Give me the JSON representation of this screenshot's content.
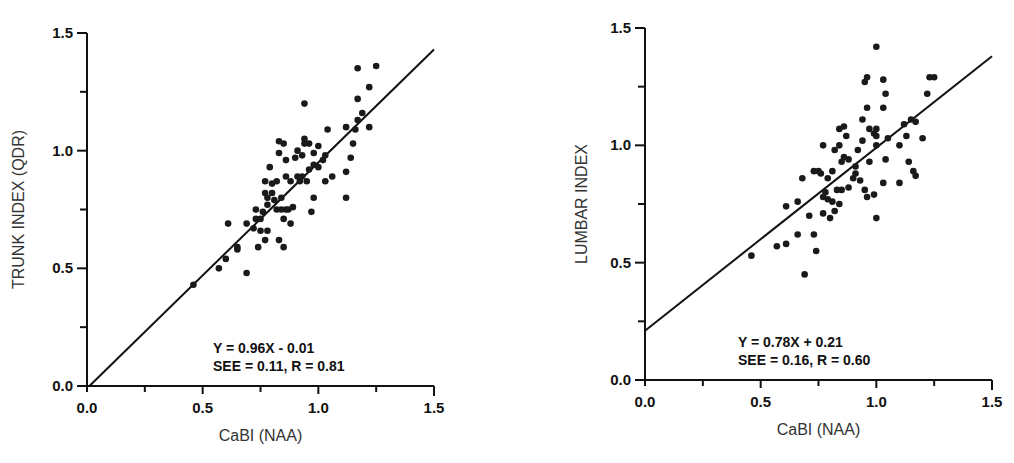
{
  "chart_data": [
    {
      "type": "scatter",
      "title": "",
      "xlabel": "CaBI (NAA)",
      "ylabel": "TRUNK INDEX (QDR)",
      "xlim": [
        0.0,
        1.5
      ],
      "ylim": [
        0.0,
        1.5
      ],
      "xticks": [
        "0.0",
        "0.5",
        "1.0",
        "1.5"
      ],
      "yticks": [
        "0.0",
        "0.5",
        "1.0",
        "1.5"
      ],
      "grid": false,
      "regression": {
        "slope": 0.96,
        "intercept": -0.01
      },
      "annotation": [
        "Y = 0.96X - 0.01",
        "SEE = 0.11, R = 0.81"
      ],
      "points": [
        [
          0.46,
          0.43
        ],
        [
          0.57,
          0.5
        ],
        [
          0.6,
          0.54
        ],
        [
          0.61,
          0.69
        ],
        [
          0.65,
          0.59
        ],
        [
          0.65,
          0.58
        ],
        [
          0.69,
          0.48
        ],
        [
          0.69,
          0.69
        ],
        [
          0.72,
          0.67
        ],
        [
          0.73,
          0.71
        ],
        [
          0.73,
          0.75
        ],
        [
          0.74,
          0.59
        ],
        [
          0.75,
          0.66
        ],
        [
          0.75,
          0.71
        ],
        [
          0.76,
          0.74
        ],
        [
          0.77,
          0.82
        ],
        [
          0.77,
          0.87
        ],
        [
          0.77,
          0.62
        ],
        [
          0.78,
          0.66
        ],
        [
          0.78,
          0.8
        ],
        [
          0.78,
          0.77
        ],
        [
          0.79,
          0.93
        ],
        [
          0.8,
          0.82
        ],
        [
          0.8,
          0.86
        ],
        [
          0.81,
          0.79
        ],
        [
          0.82,
          0.75
        ],
        [
          0.82,
          0.87
        ],
        [
          0.83,
          0.99
        ],
        [
          0.83,
          1.04
        ],
        [
          0.83,
          0.62
        ],
        [
          0.84,
          0.8
        ],
        [
          0.84,
          0.75
        ],
        [
          0.85,
          0.59
        ],
        [
          0.85,
          0.71
        ],
        [
          0.85,
          1.03
        ],
        [
          0.86,
          0.75
        ],
        [
          0.86,
          0.89
        ],
        [
          0.86,
          0.96
        ],
        [
          0.87,
          0.75
        ],
        [
          0.88,
          0.69
        ],
        [
          0.88,
          0.87
        ],
        [
          0.89,
          0.76
        ],
        [
          0.9,
          0.97
        ],
        [
          0.91,
          0.89
        ],
        [
          0.91,
          1.0
        ],
        [
          0.92,
          0.87
        ],
        [
          0.93,
          0.89
        ],
        [
          0.93,
          0.98
        ],
        [
          0.94,
          1.03
        ],
        [
          0.94,
          1.05
        ],
        [
          0.94,
          1.2
        ],
        [
          0.95,
          0.87
        ],
        [
          0.96,
          0.92
        ],
        [
          0.96,
          1.03
        ],
        [
          0.97,
          0.74
        ],
        [
          0.98,
          0.8
        ],
        [
          0.98,
          0.94
        ],
        [
          0.98,
          0.99
        ],
        [
          1.0,
          1.02
        ],
        [
          1.0,
          0.93
        ],
        [
          1.02,
          0.96
        ],
        [
          1.03,
          0.98
        ],
        [
          1.03,
          0.87
        ],
        [
          1.04,
          1.09
        ],
        [
          1.06,
          0.89
        ],
        [
          1.12,
          0.91
        ],
        [
          1.12,
          0.8
        ],
        [
          1.12,
          1.1
        ],
        [
          1.14,
          0.97
        ],
        [
          1.15,
          1.03
        ],
        [
          1.16,
          1.09
        ],
        [
          1.17,
          1.13
        ],
        [
          1.17,
          1.22
        ],
        [
          1.17,
          1.35
        ],
        [
          1.19,
          1.16
        ],
        [
          1.22,
          1.1
        ],
        [
          1.22,
          1.27
        ],
        [
          1.25,
          1.36
        ]
      ]
    },
    {
      "type": "scatter",
      "title": "",
      "xlabel": "CaBI (NAA)",
      "ylabel": "LUMBAR INDEX",
      "xlim": [
        0.0,
        1.5
      ],
      "ylim": [
        0.0,
        1.5
      ],
      "xticks": [
        "0.0",
        "0.5",
        "1.0",
        "1.5"
      ],
      "yticks": [
        "0.0",
        "0.5",
        "1.0",
        "1.5"
      ],
      "grid": false,
      "regression": {
        "slope": 0.78,
        "intercept": 0.21
      },
      "annotation": [
        "Y = 0.78X + 0.21",
        "SEE = 0.16, R = 0.60"
      ],
      "points": [
        [
          0.46,
          0.53
        ],
        [
          0.57,
          0.57
        ],
        [
          0.61,
          0.58
        ],
        [
          0.61,
          0.74
        ],
        [
          0.66,
          0.62
        ],
        [
          0.66,
          0.76
        ],
        [
          0.69,
          0.45
        ],
        [
          0.68,
          0.86
        ],
        [
          0.71,
          0.7
        ],
        [
          0.73,
          0.89
        ],
        [
          0.73,
          0.62
        ],
        [
          0.74,
          0.55
        ],
        [
          0.75,
          0.89
        ],
        [
          0.76,
          0.88
        ],
        [
          0.77,
          0.78
        ],
        [
          0.77,
          1.0
        ],
        [
          0.77,
          0.71
        ],
        [
          0.78,
          0.8
        ],
        [
          0.79,
          0.86
        ],
        [
          0.79,
          0.77
        ],
        [
          0.8,
          0.69
        ],
        [
          0.81,
          0.89
        ],
        [
          0.81,
          0.76
        ],
        [
          0.82,
          0.98
        ],
        [
          0.82,
          0.72
        ],
        [
          0.83,
          0.81
        ],
        [
          0.84,
          0.75
        ],
        [
          0.84,
          1.0
        ],
        [
          0.84,
          1.07
        ],
        [
          0.85,
          0.93
        ],
        [
          0.85,
          0.81
        ],
        [
          0.86,
          0.95
        ],
        [
          0.86,
          1.08
        ],
        [
          0.87,
          1.04
        ],
        [
          0.88,
          0.94
        ],
        [
          0.88,
          0.82
        ],
        [
          0.9,
          0.86
        ],
        [
          0.91,
          0.91
        ],
        [
          0.91,
          0.88
        ],
        [
          0.92,
          0.98
        ],
        [
          0.93,
          0.85
        ],
        [
          0.94,
          1.02
        ],
        [
          0.94,
          1.11
        ],
        [
          0.95,
          1.27
        ],
        [
          0.95,
          0.81
        ],
        [
          0.96,
          0.78
        ],
        [
          0.96,
          1.16
        ],
        [
          0.96,
          1.29
        ],
        [
          0.97,
          1.07
        ],
        [
          0.97,
          0.93
        ],
        [
          0.99,
          0.79
        ],
        [
          0.99,
          1.05
        ],
        [
          1.0,
          1.04
        ],
        [
          1.0,
          1.07
        ],
        [
          1.0,
          0.69
        ],
        [
          1.0,
          1.42
        ],
        [
          1.0,
          1.0
        ],
        [
          1.03,
          1.16
        ],
        [
          1.03,
          1.28
        ],
        [
          1.03,
          0.84
        ],
        [
          1.04,
          1.22
        ],
        [
          1.04,
          0.94
        ],
        [
          1.05,
          1.03
        ],
        [
          1.1,
          1.0
        ],
        [
          1.1,
          0.84
        ],
        [
          1.12,
          1.09
        ],
        [
          1.13,
          1.04
        ],
        [
          1.14,
          0.93
        ],
        [
          1.15,
          1.11
        ],
        [
          1.16,
          0.89
        ],
        [
          1.17,
          1.1
        ],
        [
          1.17,
          0.87
        ],
        [
          1.2,
          1.03
        ],
        [
          1.22,
          1.22
        ],
        [
          1.23,
          1.29
        ],
        [
          1.25,
          1.29
        ]
      ]
    }
  ]
}
